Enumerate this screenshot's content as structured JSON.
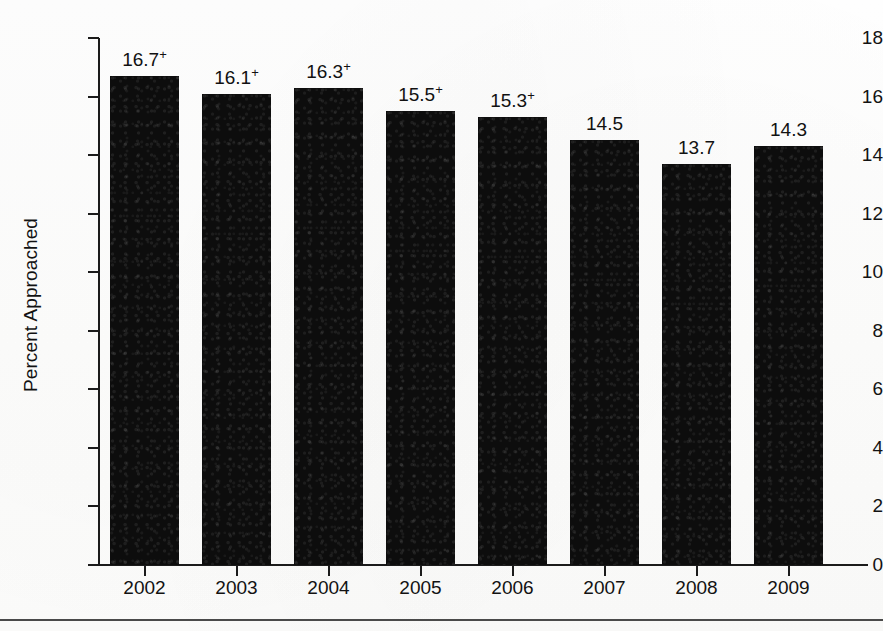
{
  "chart_data": {
    "type": "bar",
    "title": "",
    "xlabel": "",
    "ylabel": "Percent Approached",
    "categories": [
      "2002",
      "2003",
      "2004",
      "2005",
      "2006",
      "2007",
      "2008",
      "2009"
    ],
    "values": [
      16.7,
      16.1,
      16.3,
      15.5,
      15.3,
      14.5,
      13.7,
      14.3
    ],
    "data_labels": [
      "16.7",
      "16.1",
      "16.3",
      "15.5",
      "15.3",
      "14.5",
      "13.7",
      "14.3"
    ],
    "label_suffixes": [
      "+",
      "+",
      "+",
      "+",
      "+",
      "",
      "",
      ""
    ],
    "ylim": [
      0,
      18
    ],
    "y_ticks": [
      "18",
      "16",
      "14",
      "12",
      "10",
      "8",
      "6",
      "4",
      "2",
      "0"
    ],
    "y_tick_values": [
      18,
      16,
      14,
      12,
      10,
      8,
      6,
      4,
      2,
      0
    ],
    "grid": false,
    "legend": "none",
    "bar_color": "#0d0d0d",
    "axis_color": "#1b1b1b",
    "text_color": "#121212",
    "background_color": "#fefefe"
  },
  "figure": {
    "rule_color": "#4a4a4a"
  }
}
